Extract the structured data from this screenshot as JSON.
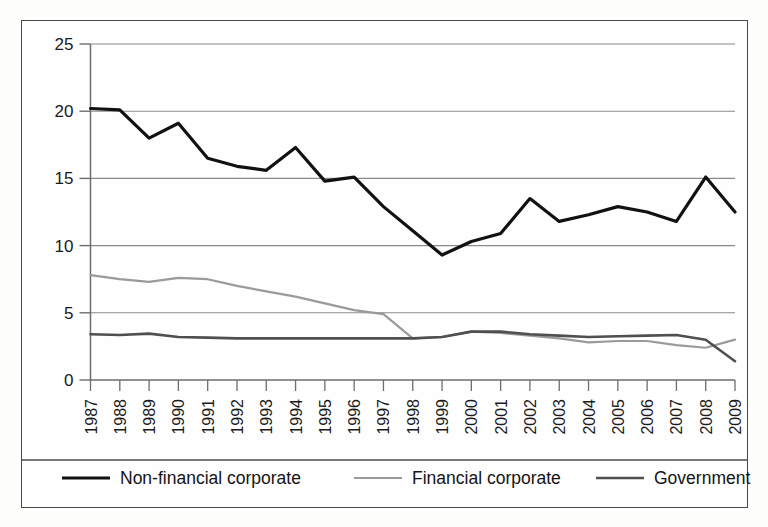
{
  "chart_data": {
    "type": "line",
    "title": "",
    "xlabel": "",
    "ylabel": "",
    "ylim": [
      0,
      25
    ],
    "yticks": [
      0,
      5,
      10,
      15,
      20,
      25
    ],
    "grid": true,
    "legend_position": "bottom",
    "categories": [
      "1987",
      "1988",
      "1989",
      "1990",
      "1991",
      "1992",
      "1993",
      "1994",
      "1995",
      "1996",
      "1997",
      "1998",
      "1999",
      "2000",
      "2001",
      "2002",
      "2003",
      "2004",
      "2005",
      "2006",
      "2007",
      "2008",
      "2009"
    ],
    "series": [
      {
        "name": "Non-financial corporate",
        "color": "#111111",
        "width": 3.2,
        "values": [
          20.2,
          20.1,
          18.0,
          19.1,
          16.5,
          15.9,
          15.6,
          17.3,
          14.8,
          15.1,
          12.9,
          11.1,
          9.3,
          10.3,
          10.9,
          13.5,
          11.8,
          12.3,
          12.9,
          12.5,
          11.8,
          15.1,
          12.5
        ]
      },
      {
        "name": "Financial corporate",
        "color": "#9a9a9a",
        "width": 2.2,
        "values": [
          7.8,
          7.5,
          7.3,
          7.6,
          7.5,
          7.0,
          6.6,
          6.2,
          5.7,
          5.2,
          4.9,
          3.1,
          3.2,
          3.6,
          3.5,
          3.3,
          3.1,
          2.8,
          2.9,
          2.9,
          2.6,
          2.4,
          3.0
        ]
      },
      {
        "name": "Government",
        "color": "#4f4f4f",
        "width": 2.6,
        "values": [
          3.4,
          3.35,
          3.45,
          3.2,
          3.15,
          3.1,
          3.1,
          3.1,
          3.1,
          3.1,
          3.1,
          3.1,
          3.2,
          3.6,
          3.6,
          3.4,
          3.3,
          3.2,
          3.25,
          3.3,
          3.35,
          3.0,
          1.4
        ]
      }
    ],
    "legend": [
      {
        "label": "Non-financial corporate",
        "color": "#111111",
        "width": 3.2
      },
      {
        "label": "Financial corporate",
        "color": "#9a9a9a",
        "width": 2.2
      },
      {
        "label": "Government",
        "color": "#4f4f4f",
        "width": 2.6
      }
    ],
    "axis_color": "#6d6d6d",
    "grid_color": "#8a8a8a",
    "frame_color": "#4a4a4a"
  }
}
